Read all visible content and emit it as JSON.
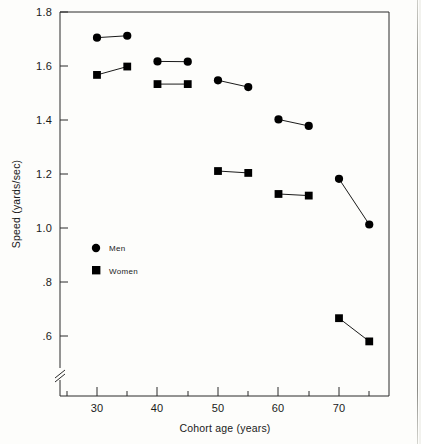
{
  "chart_data": {
    "type": "scatter",
    "title": "",
    "xlabel": "Cohort age (years)",
    "ylabel": "Speed (yards/sec)",
    "xlim": [
      24,
      78
    ],
    "ylim": [
      0.5,
      1.8
    ],
    "y_axis_break": true,
    "grid": false,
    "legend_position": "inside-left",
    "x_ticks_major": [
      30,
      40,
      50,
      60,
      70
    ],
    "x_ticks_major_labels": [
      "30",
      "40",
      "50",
      "60",
      "70"
    ],
    "x_ticks_minor": [
      25,
      35,
      45,
      55,
      65,
      75
    ],
    "y_ticks": [
      1.8,
      1.6,
      1.4,
      1.2,
      1.0,
      0.8,
      0.6
    ],
    "y_tick_labels": [
      "1.8",
      "1.6",
      "1.4",
      "1.2",
      "1.0",
      ".8",
      ".6"
    ],
    "series": [
      {
        "name": "Men",
        "marker": "circle",
        "color": "#000000",
        "points": [
          {
            "x": 30,
            "y": 1.705
          },
          {
            "x": 35,
            "y": 1.712
          },
          {
            "x": 40,
            "y": 1.617
          },
          {
            "x": 45,
            "y": 1.616
          },
          {
            "x": 50,
            "y": 1.547
          },
          {
            "x": 55,
            "y": 1.522
          },
          {
            "x": 60,
            "y": 1.402
          },
          {
            "x": 65,
            "y": 1.378
          },
          {
            "x": 70,
            "y": 1.182
          },
          {
            "x": 75,
            "y": 1.013
          }
        ],
        "connections": [
          [
            30,
            35
          ],
          [
            40,
            45
          ],
          [
            50,
            55
          ],
          [
            60,
            65
          ],
          [
            70,
            75
          ]
        ]
      },
      {
        "name": "Women",
        "marker": "square",
        "color": "#000000",
        "points": [
          {
            "x": 30,
            "y": 1.567
          },
          {
            "x": 35,
            "y": 1.598
          },
          {
            "x": 40,
            "y": 1.533
          },
          {
            "x": 45,
            "y": 1.533
          },
          {
            "x": 50,
            "y": 1.211
          },
          {
            "x": 55,
            "y": 1.204
          },
          {
            "x": 60,
            "y": 1.126
          },
          {
            "x": 65,
            "y": 1.12
          },
          {
            "x": 70,
            "y": 0.666
          },
          {
            "x": 75,
            "y": 0.58
          }
        ],
        "connections": [
          [
            30,
            35
          ],
          [
            40,
            45
          ],
          [
            50,
            55
          ],
          [
            60,
            65
          ],
          [
            70,
            75
          ]
        ]
      }
    ],
    "legend": [
      {
        "label": "Men",
        "marker": "circle"
      },
      {
        "label": "Women",
        "marker": "square"
      }
    ]
  },
  "axes": {
    "y_title": "Speed (yards/sec)",
    "x_title": "Cohort age (years)"
  },
  "colors": {
    "ink": "#000000",
    "frame": "#2b2b2b",
    "background": "#fdfdfb"
  }
}
